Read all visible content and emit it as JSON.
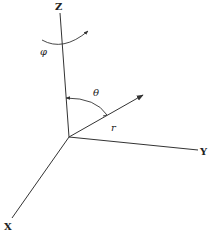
{
  "diagram": {
    "type": "spherical-coordinate-system",
    "colors": {
      "line": "#333333",
      "text": "#222222",
      "background": "#ffffff"
    },
    "origin": {
      "x": 69,
      "y": 137
    },
    "axes": {
      "z": {
        "label": "Z",
        "end": {
          "x": 60,
          "y": 13
        },
        "label_pos": {
          "x": 55,
          "y": 10
        }
      },
      "y": {
        "label": "Y",
        "end": {
          "x": 198,
          "y": 150
        },
        "label_pos": {
          "x": 200,
          "y": 155
        }
      },
      "x": {
        "label": "X",
        "end": {
          "x": 12,
          "y": 218
        },
        "label_pos": {
          "x": 4,
          "y": 230
        }
      }
    },
    "vector": {
      "label": "r",
      "end": {
        "x": 143,
        "y": 95
      },
      "label_pos": {
        "x": 111,
        "y": 131
      }
    },
    "angles": {
      "theta": {
        "label": "θ",
        "label_pos": {
          "x": 93,
          "y": 96
        }
      },
      "phi": {
        "label": "φ",
        "label_pos": {
          "x": 40,
          "y": 55
        }
      }
    }
  }
}
